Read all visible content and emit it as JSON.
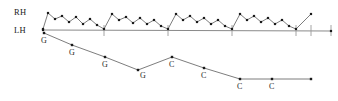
{
  "figure": {
    "width": 338,
    "height": 101,
    "background_color": "#ffffff"
  },
  "labels": {
    "rh": "RH",
    "lh": "LH"
  },
  "colors": {
    "line": "#6e6e6e",
    "baseline": "#8a8a8a",
    "marker": "#1a1a1a",
    "text": "#1a1a1a",
    "tick": "#9a9a9a"
  },
  "chart_data": {
    "type": "line",
    "xlabel": "",
    "ylabel": "",
    "xlim": [
      0,
      338
    ],
    "ylim": [
      101,
      0
    ],
    "grid": false,
    "legend": "none",
    "series": [
      {
        "name": "RH",
        "label": "RH",
        "marker": "square",
        "points": [
          {
            "x": 43,
            "y": 29
          },
          {
            "x": 48,
            "y": 13
          },
          {
            "x": 55,
            "y": 19
          },
          {
            "x": 62,
            "y": 16
          },
          {
            "x": 69,
            "y": 22
          },
          {
            "x": 76,
            "y": 17
          },
          {
            "x": 83,
            "y": 24
          },
          {
            "x": 90,
            "y": 19
          },
          {
            "x": 97,
            "y": 25
          },
          {
            "x": 104,
            "y": 29
          },
          {
            "x": 112,
            "y": 14
          },
          {
            "x": 119,
            "y": 20
          },
          {
            "x": 126,
            "y": 17
          },
          {
            "x": 133,
            "y": 23
          },
          {
            "x": 140,
            "y": 18
          },
          {
            "x": 147,
            "y": 24
          },
          {
            "x": 154,
            "y": 20
          },
          {
            "x": 161,
            "y": 26
          },
          {
            "x": 168,
            "y": 29
          },
          {
            "x": 176,
            "y": 14
          },
          {
            "x": 183,
            "y": 20
          },
          {
            "x": 190,
            "y": 16
          },
          {
            "x": 197,
            "y": 22
          },
          {
            "x": 204,
            "y": 18
          },
          {
            "x": 211,
            "y": 24
          },
          {
            "x": 218,
            "y": 20
          },
          {
            "x": 225,
            "y": 26
          },
          {
            "x": 232,
            "y": 29
          },
          {
            "x": 240,
            "y": 14
          },
          {
            "x": 247,
            "y": 20
          },
          {
            "x": 254,
            "y": 16
          },
          {
            "x": 261,
            "y": 22
          },
          {
            "x": 268,
            "y": 18
          },
          {
            "x": 275,
            "y": 24
          },
          {
            "x": 282,
            "y": 20
          },
          {
            "x": 289,
            "y": 26
          },
          {
            "x": 296,
            "y": 29
          },
          {
            "x": 311,
            "y": 14
          }
        ]
      },
      {
        "name": "LH",
        "label": "LH",
        "marker": "square",
        "points": [
          {
            "x": 43,
            "y": 30
          },
          {
            "x": 331,
            "y": 31
          }
        ],
        "ticks": [
          104,
          168,
          232,
          296,
          311,
          331
        ]
      },
      {
        "name": "notes",
        "label": "note trajectory",
        "marker": "square",
        "points": [
          {
            "x": 44,
            "y": 33
          },
          {
            "x": 72,
            "y": 45
          },
          {
            "x": 105,
            "y": 57
          },
          {
            "x": 138,
            "y": 70
          },
          {
            "x": 172,
            "y": 57
          },
          {
            "x": 204,
            "y": 68
          },
          {
            "x": 240,
            "y": 79
          },
          {
            "x": 272,
            "y": 79
          },
          {
            "x": 311,
            "y": 79
          }
        ],
        "annotations": [
          {
            "x": 44,
            "y": 33,
            "text": "G",
            "label_x": 41,
            "label_y": 43
          },
          {
            "x": 72,
            "y": 45,
            "text": "G",
            "label_x": 69,
            "label_y": 55
          },
          {
            "x": 105,
            "y": 57,
            "text": "G",
            "label_x": 102,
            "label_y": 67
          },
          {
            "x": 138,
            "y": 70,
            "text": "G",
            "label_x": 140,
            "label_y": 78
          },
          {
            "x": 172,
            "y": 57,
            "text": "C",
            "label_x": 169,
            "label_y": 67
          },
          {
            "x": 204,
            "y": 68,
            "text": "C",
            "label_x": 201,
            "label_y": 78
          },
          {
            "x": 240,
            "y": 79,
            "text": "C",
            "label_x": 237,
            "label_y": 89
          },
          {
            "x": 272,
            "y": 79,
            "text": "C",
            "label_x": 269,
            "label_y": 89
          }
        ]
      }
    ]
  }
}
